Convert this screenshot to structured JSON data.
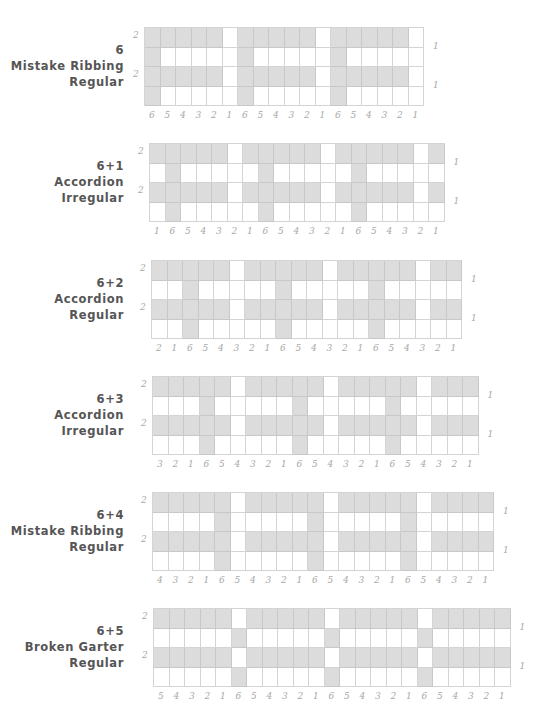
{
  "colors": {
    "shaded": "#dcdcdc",
    "empty": "#ffffff",
    "grid": "#d4d4d4",
    "title": "#555555",
    "label": "#a8a8a8"
  },
  "charts": [
    {
      "title": [
        "6",
        "Mistake Ribbing",
        "Regular"
      ],
      "left": 144,
      "top": 27,
      "col_labels": [
        "6",
        "5",
        "4",
        "3",
        "2",
        "1",
        "6",
        "5",
        "4",
        "3",
        "2",
        "1",
        "6",
        "5",
        "4",
        "3",
        "2",
        "1"
      ],
      "row_left_labels": [
        "2",
        "",
        "2",
        ""
      ],
      "row_right_labels": [
        "",
        "1",
        "",
        "1"
      ],
      "rows": [
        [
          1,
          1,
          1,
          1,
          1,
          0,
          1,
          1,
          1,
          1,
          1,
          0,
          1,
          1,
          1,
          1,
          1,
          0
        ],
        [
          1,
          0,
          0,
          0,
          0,
          0,
          1,
          0,
          0,
          0,
          0,
          0,
          1,
          0,
          0,
          0,
          0,
          0
        ],
        [
          1,
          1,
          1,
          1,
          1,
          0,
          1,
          1,
          1,
          1,
          1,
          0,
          1,
          1,
          1,
          1,
          1,
          0
        ],
        [
          1,
          0,
          0,
          0,
          0,
          0,
          1,
          0,
          0,
          0,
          0,
          0,
          1,
          0,
          0,
          0,
          0,
          0
        ]
      ]
    },
    {
      "title": [
        "6+1",
        "Accordion",
        "Irregular"
      ],
      "left": 149,
      "top": 143,
      "col_labels": [
        "1",
        "6",
        "5",
        "4",
        "3",
        "2",
        "1",
        "6",
        "5",
        "4",
        "3",
        "2",
        "1",
        "6",
        "5",
        "4",
        "3",
        "2",
        "1"
      ],
      "row_left_labels": [
        "2",
        "",
        "2",
        ""
      ],
      "row_right_labels": [
        "",
        "1",
        "",
        "1"
      ],
      "rows": [
        [
          1,
          1,
          1,
          1,
          1,
          0,
          1,
          1,
          1,
          1,
          1,
          0,
          1,
          1,
          1,
          1,
          1,
          0,
          1
        ],
        [
          0,
          1,
          0,
          0,
          0,
          0,
          0,
          1,
          0,
          0,
          0,
          0,
          0,
          1,
          0,
          0,
          0,
          0,
          0
        ],
        [
          1,
          1,
          1,
          1,
          1,
          0,
          1,
          1,
          1,
          1,
          1,
          0,
          1,
          1,
          1,
          1,
          1,
          0,
          1
        ],
        [
          0,
          1,
          0,
          0,
          0,
          0,
          0,
          1,
          0,
          0,
          0,
          0,
          0,
          1,
          0,
          0,
          0,
          0,
          0
        ]
      ]
    },
    {
      "title": [
        "6+2",
        "Accordion",
        "Regular"
      ],
      "left": 151,
      "top": 260,
      "col_labels": [
        "2",
        "1",
        "6",
        "5",
        "4",
        "3",
        "2",
        "1",
        "6",
        "5",
        "4",
        "3",
        "2",
        "1",
        "6",
        "5",
        "4",
        "3",
        "2",
        "1"
      ],
      "row_left_labels": [
        "2",
        "",
        "2",
        ""
      ],
      "row_right_labels": [
        "",
        "1",
        "",
        "1"
      ],
      "rows": [
        [
          1,
          1,
          1,
          1,
          1,
          0,
          1,
          1,
          1,
          1,
          1,
          0,
          1,
          1,
          1,
          1,
          1,
          0,
          1,
          1
        ],
        [
          0,
          0,
          1,
          0,
          0,
          0,
          0,
          0,
          1,
          0,
          0,
          0,
          0,
          0,
          1,
          0,
          0,
          0,
          0,
          0
        ],
        [
          1,
          1,
          1,
          1,
          1,
          0,
          1,
          1,
          1,
          1,
          1,
          0,
          1,
          1,
          1,
          1,
          1,
          0,
          1,
          1
        ],
        [
          0,
          0,
          1,
          0,
          0,
          0,
          0,
          0,
          1,
          0,
          0,
          0,
          0,
          0,
          1,
          0,
          0,
          0,
          0,
          0
        ]
      ]
    },
    {
      "title": [
        "6+3",
        "Accordion",
        "Irregular"
      ],
      "left": 152,
      "top": 376,
      "col_labels": [
        "3",
        "2",
        "1",
        "6",
        "5",
        "4",
        "3",
        "2",
        "1",
        "6",
        "5",
        "4",
        "3",
        "2",
        "1",
        "6",
        "5",
        "4",
        "3",
        "2",
        "1"
      ],
      "row_left_labels": [
        "2",
        "",
        "2",
        ""
      ],
      "row_right_labels": [
        "",
        "1",
        "",
        "1"
      ],
      "rows": [
        [
          1,
          1,
          1,
          1,
          1,
          0,
          1,
          1,
          1,
          1,
          1,
          0,
          1,
          1,
          1,
          1,
          1,
          0,
          1,
          1,
          1
        ],
        [
          0,
          0,
          0,
          1,
          0,
          0,
          0,
          0,
          0,
          1,
          0,
          0,
          0,
          0,
          0,
          1,
          0,
          0,
          0,
          0,
          0
        ],
        [
          1,
          1,
          1,
          1,
          1,
          0,
          1,
          1,
          1,
          1,
          1,
          0,
          1,
          1,
          1,
          1,
          1,
          0,
          1,
          1,
          1
        ],
        [
          0,
          0,
          0,
          1,
          0,
          0,
          0,
          0,
          0,
          1,
          0,
          0,
          0,
          0,
          0,
          1,
          0,
          0,
          0,
          0,
          0
        ]
      ]
    },
    {
      "title": [
        "6+4",
        "Mistake Ribbing",
        "Regular"
      ],
      "left": 152,
      "top": 492,
      "col_labels": [
        "4",
        "3",
        "2",
        "1",
        "6",
        "5",
        "4",
        "3",
        "2",
        "1",
        "6",
        "5",
        "4",
        "3",
        "2",
        "1",
        "6",
        "5",
        "4",
        "3",
        "2",
        "1"
      ],
      "row_left_labels": [
        "2",
        "",
        "2",
        ""
      ],
      "row_right_labels": [
        "",
        "1",
        "",
        "1"
      ],
      "rows": [
        [
          1,
          1,
          1,
          1,
          1,
          0,
          1,
          1,
          1,
          1,
          1,
          0,
          1,
          1,
          1,
          1,
          1,
          0,
          1,
          1,
          1,
          1
        ],
        [
          0,
          0,
          0,
          0,
          1,
          0,
          0,
          0,
          0,
          0,
          1,
          0,
          0,
          0,
          0,
          0,
          1,
          0,
          0,
          0,
          0,
          0
        ],
        [
          1,
          1,
          1,
          1,
          1,
          0,
          1,
          1,
          1,
          1,
          1,
          0,
          1,
          1,
          1,
          1,
          1,
          0,
          1,
          1,
          1,
          1
        ],
        [
          0,
          0,
          0,
          0,
          1,
          0,
          0,
          0,
          0,
          0,
          1,
          0,
          0,
          0,
          0,
          0,
          1,
          0,
          0,
          0,
          0,
          0
        ]
      ]
    },
    {
      "title": [
        "6+5",
        "Broken Garter",
        "Regular"
      ],
      "left": 153,
      "top": 608,
      "col_labels": [
        "5",
        "4",
        "3",
        "2",
        "1",
        "6",
        "5",
        "4",
        "3",
        "2",
        "1",
        "6",
        "5",
        "4",
        "3",
        "2",
        "1",
        "6",
        "5",
        "4",
        "3",
        "2",
        "1"
      ],
      "row_left_labels": [
        "2",
        "",
        "2",
        ""
      ],
      "row_right_labels": [
        "",
        "1",
        "",
        "1"
      ],
      "rows": [
        [
          1,
          1,
          1,
          1,
          1,
          0,
          1,
          1,
          1,
          1,
          1,
          0,
          1,
          1,
          1,
          1,
          1,
          0,
          1,
          1,
          1,
          1,
          1
        ],
        [
          0,
          0,
          0,
          0,
          0,
          1,
          0,
          0,
          0,
          0,
          0,
          1,
          0,
          0,
          0,
          0,
          0,
          1,
          0,
          0,
          0,
          0,
          0
        ],
        [
          1,
          1,
          1,
          1,
          1,
          0,
          1,
          1,
          1,
          1,
          1,
          0,
          1,
          1,
          1,
          1,
          1,
          0,
          1,
          1,
          1,
          1,
          1
        ],
        [
          0,
          0,
          0,
          0,
          0,
          1,
          0,
          0,
          0,
          0,
          0,
          1,
          0,
          0,
          0,
          0,
          0,
          1,
          0,
          0,
          0,
          0,
          0
        ]
      ]
    }
  ]
}
